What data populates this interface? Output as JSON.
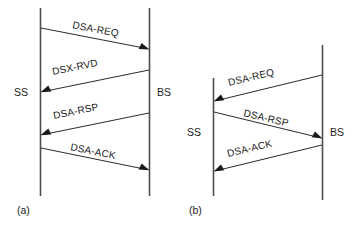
{
  "figure": {
    "background_color": "#ffffff",
    "line_color": "#2b2b2b",
    "lifeline_color": "#4d4d4d",
    "text_color": "#1a1a1a"
  },
  "panels": [
    {
      "caption": "(a)",
      "actors": [
        {
          "name": "SS",
          "label": "SS"
        },
        {
          "name": "BS",
          "label": "BS"
        }
      ],
      "messages": [
        {
          "label": "DSA-REQ",
          "from": "SS",
          "to": "BS"
        },
        {
          "label": "DSX-RVD",
          "from": "BS",
          "to": "SS"
        },
        {
          "label": "DSA-RSP",
          "from": "BS",
          "to": "SS"
        },
        {
          "label": "DSA-ACK",
          "from": "SS",
          "to": "BS"
        }
      ]
    },
    {
      "caption": "(b)",
      "actors": [
        {
          "name": "SS",
          "label": "SS"
        },
        {
          "name": "BS",
          "label": "BS"
        }
      ],
      "messages": [
        {
          "label": "DSA-REQ",
          "from": "BS",
          "to": "SS"
        },
        {
          "label": "DSA-RSP",
          "from": "SS",
          "to": "BS"
        },
        {
          "label": "DSA-ACK",
          "from": "BS",
          "to": "SS"
        }
      ]
    }
  ]
}
